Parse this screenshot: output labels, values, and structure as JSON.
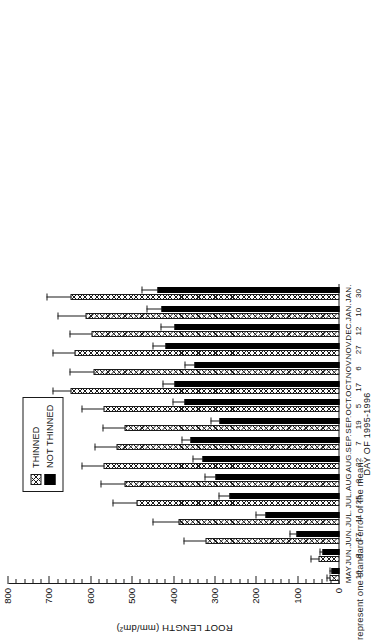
{
  "caption_fragment": "represent one standard error of the mean.",
  "chart_data": {
    "type": "bar",
    "orientation": "vertical",
    "title": "",
    "xlabel": "DAY OF 1995-1996",
    "ylabel": "ROOT LENGTH (mm/dm²)",
    "ylim": [
      0,
      800
    ],
    "ytick_step": 100,
    "yticks": [
      0,
      100,
      200,
      300,
      400,
      500,
      600,
      700,
      800
    ],
    "ytick_labels": [
      "0",
      "100",
      "200",
      "300",
      "400",
      "500",
      "600",
      "700",
      "800"
    ],
    "minor_ticks_per_major": 5,
    "grid": false,
    "legend_position": "upper-left-inside",
    "categories": [
      "MAY 16",
      "JUN. 8",
      "JUN. 27",
      "JUL. 11",
      "JUL. 25",
      "AUG. 8",
      "AUG. 22",
      "SEP. 7",
      "SEP. 19",
      "OCT. 5",
      "OCT. 17",
      "NOV. 6",
      "NOV. 27",
      "DEC. 12",
      "JAN. 10",
      "JAN. 30"
    ],
    "categories_split": [
      {
        "month": "MAY",
        "day": "16"
      },
      {
        "month": "JUN.",
        "day": "8"
      },
      {
        "month": "JUN.",
        "day": "27"
      },
      {
        "month": "JUL.",
        "day": "11"
      },
      {
        "month": "JUL.",
        "day": "25"
      },
      {
        "month": "AUG.",
        "day": "8"
      },
      {
        "month": "AUG.",
        "day": "22"
      },
      {
        "month": "SEP.",
        "day": "7"
      },
      {
        "month": "SEP.",
        "day": "19"
      },
      {
        "month": "OCT.",
        "day": "5"
      },
      {
        "month": "OCT.",
        "day": "17"
      },
      {
        "month": "NOV.",
        "day": "6"
      },
      {
        "month": "NOV.",
        "day": "27"
      },
      {
        "month": "DEC.",
        "day": "12"
      },
      {
        "month": "JAN.",
        "day": "10"
      },
      {
        "month": "JAN.",
        "day": "30"
      }
    ],
    "series": [
      {
        "name": "THINNED",
        "style": "crosshatch",
        "values": [
          25,
          50,
          325,
          390,
          490,
          520,
          570,
          540,
          520,
          570,
          650,
          595,
          640,
          600,
          615,
          650
        ],
        "errors": [
          8,
          22,
          55,
          65,
          60,
          60,
          55,
          55,
          55,
          55,
          45,
          60,
          55,
          55,
          70,
          60
        ]
      },
      {
        "name": "NOT THINNED",
        "style": "solid-black",
        "values": [
          20,
          40,
          105,
          180,
          265,
          300,
          330,
          360,
          290,
          375,
          400,
          350,
          420,
          400,
          430,
          440
        ],
        "errors": [
          6,
          10,
          18,
          25,
          30,
          28,
          28,
          25,
          25,
          32,
          30,
          28,
          35,
          35,
          40,
          40
        ]
      }
    ]
  },
  "legend": {
    "items": [
      {
        "label": "THINNED",
        "style": "crosshatch"
      },
      {
        "label": "NOT THINNED",
        "style": "solid-black"
      }
    ]
  }
}
